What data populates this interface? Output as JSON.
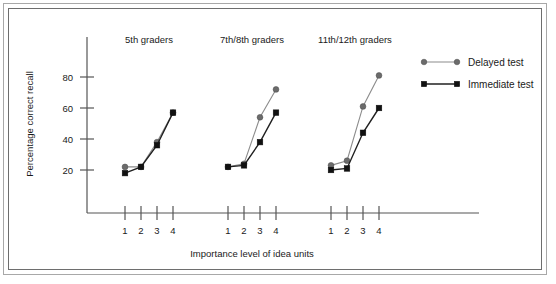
{
  "chart_data": {
    "type": "line",
    "title": "",
    "xlabel": "Importance level of idea units",
    "ylabel": "Percentage correct recall",
    "ylim": [
      0,
      90
    ],
    "yticks": [
      20,
      40,
      60,
      80
    ],
    "ytick_labels": [
      "20",
      "40",
      "60",
      "80"
    ],
    "grid": false,
    "legend_position": "right",
    "x": [
      1,
      2,
      3,
      4
    ],
    "xtick_labels": [
      "1",
      "2",
      "3",
      "4"
    ],
    "panels": [
      {
        "label": "5th graders",
        "series": [
          {
            "name": "Delayed test",
            "values": [
              22,
              22,
              38,
              57
            ]
          },
          {
            "name": "Immediate test",
            "values": [
              18,
              22,
              36,
              57
            ]
          }
        ]
      },
      {
        "label": "7th/8th graders",
        "series": [
          {
            "name": "Delayed test",
            "values": [
              22,
              24,
              54,
              72
            ]
          },
          {
            "name": "Immediate test",
            "values": [
              22,
              23,
              38,
              57
            ]
          }
        ]
      },
      {
        "label": "11th/12th graders",
        "series": [
          {
            "name": "Delayed test",
            "values": [
              23,
              26,
              61,
              81
            ]
          },
          {
            "name": "Immediate test",
            "values": [
              20,
              21,
              44,
              60
            ]
          }
        ]
      }
    ],
    "legend": [
      {
        "name": "Delayed test",
        "marker": "circle",
        "color": "#6b6b6b"
      },
      {
        "name": "Immediate test",
        "marker": "square",
        "color": "#111111"
      }
    ]
  }
}
